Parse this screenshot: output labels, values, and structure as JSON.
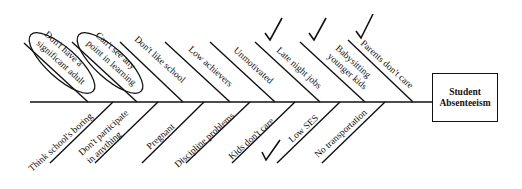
{
  "diagram": {
    "type": "fishbone",
    "effect": {
      "line1": "Student",
      "line2": "Absenteeism"
    },
    "top_causes": [
      {
        "line1": "Don't have a",
        "line2": "significant adult",
        "circled": true,
        "checked": false
      },
      {
        "line1": "Can't see any",
        "line2": "point in learning",
        "circled": true,
        "checked": false
      },
      {
        "line1": "Don't like school",
        "line2": "",
        "circled": false,
        "checked": false
      },
      {
        "line1": "Low achievers",
        "line2": "",
        "circled": false,
        "checked": false
      },
      {
        "line1": "Unmotivated",
        "line2": "",
        "circled": false,
        "checked": false
      },
      {
        "line1": "Late night jobs",
        "line2": "",
        "circled": false,
        "checked": true
      },
      {
        "line1": "Babysitting",
        "line2": "younger kids",
        "circled": false,
        "checked": true
      },
      {
        "line1": "Parents don't care",
        "line2": "",
        "circled": false,
        "checked": true
      }
    ],
    "bottom_causes": [
      {
        "line1": "Think school's boring",
        "line2": "",
        "checked": false
      },
      {
        "line1": "Don't participate",
        "line2": "in anything",
        "checked": false
      },
      {
        "line1": "Pregnant",
        "line2": "",
        "checked": false
      },
      {
        "line1": "Discipline problems",
        "line2": "",
        "checked": false
      },
      {
        "line1": "Kids don't care",
        "line2": "",
        "checked": false
      },
      {
        "line1": "Low SES",
        "line2": "",
        "checked": true
      },
      {
        "line1": "No transportation",
        "line2": "",
        "checked": false
      }
    ]
  }
}
